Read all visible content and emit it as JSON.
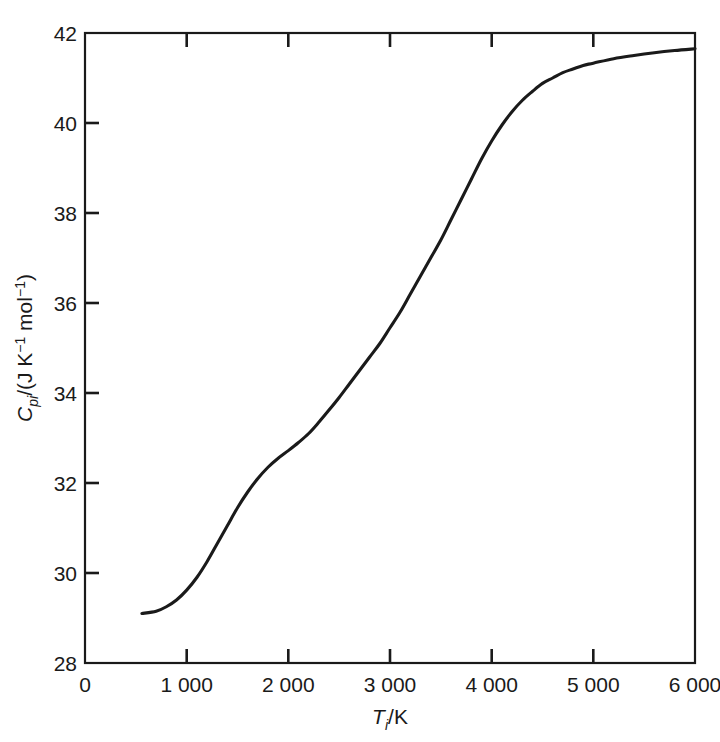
{
  "chart_data": {
    "type": "line",
    "title": "",
    "xlabel": "T_i/K",
    "ylabel": "C_pi/(J K^-1 mol^-1)",
    "xlim": [
      0,
      6000
    ],
    "ylim": [
      28,
      42
    ],
    "grid": false,
    "legend": null,
    "line_color": "#1a1a1a",
    "x_tick_labels": [
      "0",
      "1 000",
      "2 000",
      "3 000",
      "4 000",
      "5 000",
      "6 000"
    ],
    "x_ticks": [
      0,
      1000,
      2000,
      3000,
      4000,
      5000,
      6000
    ],
    "y_tick_labels": [
      "28",
      "30",
      "32",
      "34",
      "36",
      "38",
      "40",
      "42"
    ],
    "y_ticks": [
      28,
      30,
      32,
      34,
      36,
      38,
      40,
      42
    ],
    "series": [
      {
        "name": "heat capacity",
        "x": [
          560,
          700,
          800,
          900,
          1000,
          1100,
          1200,
          1300,
          1400,
          1500,
          1600,
          1700,
          1800,
          1900,
          2000,
          2100,
          2200,
          2300,
          2400,
          2500,
          2600,
          2700,
          2800,
          2900,
          3000,
          3100,
          3200,
          3300,
          3400,
          3500,
          3600,
          3700,
          3800,
          3900,
          4000,
          4100,
          4200,
          4300,
          4400,
          4500,
          4600,
          4700,
          4800,
          4900,
          5000,
          5200,
          5400,
          5600,
          5800,
          6000
        ],
        "y": [
          29.1,
          29.15,
          29.25,
          29.4,
          29.62,
          29.9,
          30.25,
          30.65,
          31.05,
          31.45,
          31.8,
          32.1,
          32.35,
          32.55,
          32.72,
          32.9,
          33.1,
          33.35,
          33.62,
          33.9,
          34.2,
          34.5,
          34.8,
          35.1,
          35.45,
          35.8,
          36.2,
          36.6,
          37.0,
          37.4,
          37.85,
          38.3,
          38.75,
          39.2,
          39.6,
          39.95,
          40.25,
          40.5,
          40.7,
          40.88,
          41.0,
          41.12,
          41.2,
          41.28,
          41.33,
          41.43,
          41.5,
          41.56,
          41.61,
          41.65
        ]
      }
    ]
  },
  "axes": {
    "y_title_parts": {
      "symbol": "C",
      "symbol_sub": "pi",
      "slash": "/(J K",
      "exp1": "−1",
      "mid": " mol",
      "exp2": "−1",
      "close": ")"
    },
    "x_title_parts": {
      "symbol": "T",
      "symbol_sub": "i",
      "rest": "/K"
    }
  }
}
